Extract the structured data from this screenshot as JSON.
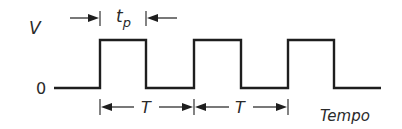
{
  "diagram": {
    "y_axis_label": "V",
    "baseline_label": "0",
    "x_axis_label": "Tempo",
    "pulse_width_label": "t",
    "pulse_width_subscript": "p",
    "period_label": "T",
    "pulse_count": 3,
    "period_annotations": 2,
    "waveform": {
      "type": "square",
      "levels": [
        "0",
        "V"
      ],
      "sequence": [
        "low",
        "high",
        "low",
        "high",
        "low",
        "high",
        "low"
      ]
    },
    "colors": {
      "line": "#1e1e1e",
      "text": "#2a2a2a",
      "background": "#ffffff"
    }
  }
}
